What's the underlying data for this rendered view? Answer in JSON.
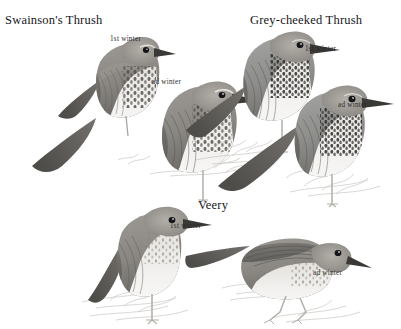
{
  "plate": {
    "medium": "grayscale pencil and wash field-guide illustration",
    "background_color": "#ffffff",
    "ink_color": "#15161a",
    "label_color": "#2b2b2b"
  },
  "species": [
    {
      "id": "swainsons-thrush",
      "title": "Swainson's Thrush",
      "title_position": {
        "x": 5,
        "y": 13
      },
      "birds": [
        {
          "id": "swainsons-1st-winter",
          "age_label": "1st winter",
          "label_position": {
            "x": 110,
            "y": 35
          },
          "pose": "perched, facing right, rear bird",
          "plumage_tone": "#8e8a84"
        },
        {
          "id": "swainsons-ad-winter",
          "age_label": "ad winter",
          "label_position": {
            "x": 152,
            "y": 78
          },
          "pose": "perched on ground, facing right, front bird",
          "plumage_tone": "#807c76"
        }
      ]
    },
    {
      "id": "grey-cheeked-thrush",
      "title": "Grey-cheeked Thrush",
      "title_position": {
        "x": 250,
        "y": 13
      },
      "birds": [
        {
          "id": "grey-cheeked-1st-winter",
          "age_label": "1st winter",
          "label_position": {
            "x": 305,
            "y": 45
          },
          "pose": "perched, facing right, rear bird",
          "plumage_tone": "#8b8a88"
        },
        {
          "id": "grey-cheeked-ad-winter",
          "age_label": "ad winter",
          "label_position": {
            "x": 338,
            "y": 101
          },
          "pose": "perched on ground, facing right, front bird",
          "plumage_tone": "#84817d"
        }
      ]
    },
    {
      "id": "veery",
      "title": "Veery",
      "title_position": {
        "x": 198,
        "y": 198
      },
      "birds": [
        {
          "id": "veery-1st-winter",
          "age_label": "1st winter",
          "label_position": {
            "x": 170,
            "y": 222
          },
          "pose": "upright, facing right, standing on ground",
          "plumage_tone": "#8a8580"
        },
        {
          "id": "veery-ad-winter",
          "age_label": "ad winter",
          "label_position": {
            "x": 313,
            "y": 269
          },
          "pose": "horizontal walking posture, facing right",
          "plumage_tone": "#87837e"
        }
      ]
    }
  ]
}
